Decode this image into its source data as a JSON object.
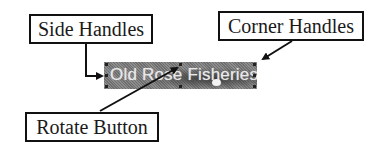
{
  "labels": {
    "side_handles": "Side Handles",
    "corner_handles": "Corner Handles",
    "rotate_button": "Rotate Button"
  },
  "banner": {
    "text": "Old Rose Fisheries"
  },
  "colors": {
    "border": "#111111",
    "banner_bg": "#808080",
    "banner_text": "#e8e8e8"
  }
}
